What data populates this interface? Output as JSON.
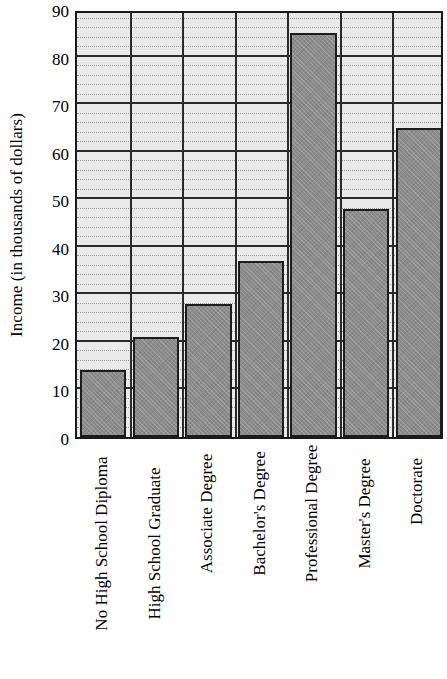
{
  "chart_data": {
    "type": "bar",
    "title": "",
    "xlabel": "",
    "ylabel": "Income (in thousands of dollars)",
    "categories": [
      "No High School Diploma",
      "High School Graduate",
      "Associate Degree",
      "Bachelor's Degree",
      "Professional Degree",
      "Master's Degree",
      "Doctorate"
    ],
    "values": [
      14,
      21,
      28,
      37,
      85,
      48,
      65
    ],
    "ylim": [
      0,
      90
    ],
    "y_ticks": [
      0,
      10,
      20,
      30,
      40,
      50,
      60,
      70,
      80,
      90
    ],
    "y_tick_labels": [
      "0",
      "10",
      "20",
      "30",
      "40",
      "50",
      "60",
      "70",
      "80",
      "90"
    ],
    "y_minor_step": 2,
    "grid": "horizontal-major-and-minor, vertical-category-separators",
    "legend": "none",
    "bar_color": "#8c8c8c",
    "bar_edge_color": "#1c1c1c",
    "plot_background_color": "#e9e9e9",
    "axis_color": "#1a1a1a"
  }
}
